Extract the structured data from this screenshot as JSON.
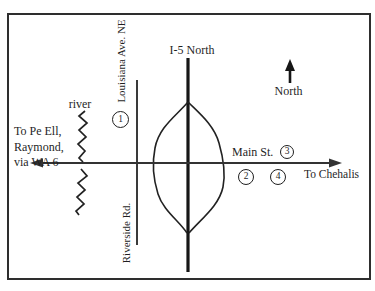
{
  "map": {
    "compass": {
      "label": "North"
    },
    "roads": {
      "i5_label": "I-5 North",
      "main_label": "Main St.",
      "louisiana_label": "Louisiana Ave. NE",
      "riverside_label": "Riverside Rd."
    },
    "destinations": {
      "west_line1": "To Pe Ell,",
      "west_line2": "Raymond,",
      "west_line3": "via WA 6",
      "east": "To Chehalis"
    },
    "river_label": "river",
    "markers": [
      {
        "number": "1"
      },
      {
        "number": "2"
      },
      {
        "number": "3"
      },
      {
        "number": "4"
      }
    ],
    "colors": {
      "ink": "#1f1f1f",
      "background": "#ffffff"
    }
  }
}
